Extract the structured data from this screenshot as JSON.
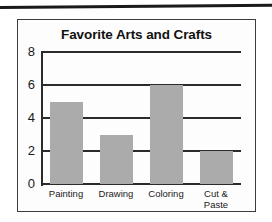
{
  "chart_data": {
    "type": "bar",
    "title": "Favorite Arts and Crafts",
    "categories": [
      "Painting",
      "Drawing",
      "Coloring",
      "Cut &\nPaste"
    ],
    "values": [
      5,
      3,
      6,
      2
    ],
    "xlabel": "",
    "ylabel": "",
    "ylim": [
      0,
      8
    ],
    "yticks": [
      0,
      2,
      4,
      6,
      8
    ],
    "ytick_labels": [
      "0",
      "2",
      "4",
      "6",
      "8"
    ],
    "grid": true,
    "legend": false,
    "bar_color": "#ababab",
    "axis_color": "#2b2b2b",
    "background": "#fdfdfd",
    "border_color": "#3c3c3c"
  }
}
